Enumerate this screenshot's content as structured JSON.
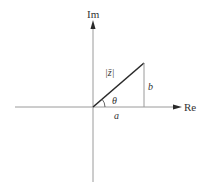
{
  "diagram": {
    "colors": {
      "axis": "#9a9a9a",
      "vector": "#2a2a2a",
      "text": "#333333",
      "background": "#ffffff"
    },
    "axes": {
      "real_label": "Re",
      "imag_label": "Im"
    },
    "labels": {
      "modulus": "|z̄|",
      "angle": "θ",
      "real_part": "a",
      "imag_part": "b"
    },
    "geometry": {
      "origin": [
        93,
        107
      ],
      "point": [
        144,
        63
      ],
      "re_axis": {
        "x1": 15,
        "x2": 182,
        "y": 107
      },
      "im_axis": {
        "x": 93,
        "y1": 20,
        "y2": 182
      }
    }
  }
}
